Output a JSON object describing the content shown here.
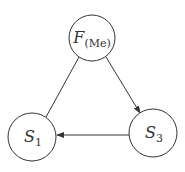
{
  "diagram": {
    "nodes": [
      {
        "id": "F",
        "label": "F",
        "subscript": "(Me)",
        "cx": 92,
        "cy": 38,
        "r": 23
      },
      {
        "id": "S1",
        "label": "S",
        "subscript": "1",
        "cx": 32,
        "cy": 137,
        "r": 24
      },
      {
        "id": "S3",
        "label": "S",
        "subscript": "3",
        "cx": 153,
        "cy": 133,
        "r": 24
      }
    ],
    "edges": [
      {
        "from": "F",
        "to": "S1",
        "arrow": false
      },
      {
        "from": "F",
        "to": "S3",
        "arrow": true
      },
      {
        "from": "S3",
        "to": "S1",
        "arrow": true
      }
    ],
    "colors": {
      "stroke": "#333333",
      "background": "#ffffff"
    }
  }
}
